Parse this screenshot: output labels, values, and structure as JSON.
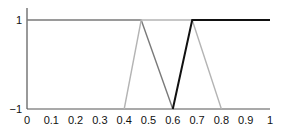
{
  "chart_data": {
    "type": "line",
    "title": "",
    "xlabel": "",
    "ylabel": "",
    "xlim": [
      0,
      1
    ],
    "ylim": [
      -1,
      1
    ],
    "grid": false,
    "legend": null,
    "x_ticks": [
      "0",
      "0.1",
      "0.2",
      "0.3",
      "0.4",
      "0.5",
      "0.6",
      "0.7",
      "0.8",
      "0.9",
      "1"
    ],
    "y_ticks": [
      "1",
      "−1"
    ],
    "series": [
      {
        "name": "membership-1",
        "color": "#7a7a7a",
        "x": [
          0,
          0.47,
          0.6
        ],
        "y": [
          1,
          1,
          -1
        ]
      },
      {
        "name": "membership-2",
        "color": "#b4b4b4",
        "x": [
          0.4,
          0.47,
          0.68,
          0.8
        ],
        "y": [
          -1,
          1,
          1,
          -1
        ]
      },
      {
        "name": "membership-3",
        "color": "#111111",
        "x": [
          0.6,
          0.68,
          1.0
        ],
        "y": [
          -1,
          1,
          1
        ]
      }
    ]
  }
}
